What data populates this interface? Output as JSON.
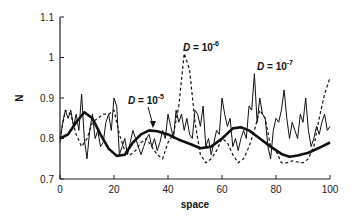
{
  "chart_data": {
    "type": "line",
    "title": "",
    "xlabel": "space",
    "ylabel": "N",
    "xlim": [
      0,
      100
    ],
    "ylim": [
      0.7,
      1.1
    ],
    "x_ticks": [
      "0",
      "20",
      "40",
      "60",
      "80",
      "100"
    ],
    "y_ticks": [
      "0.7",
      "0.8",
      "0.9",
      "1",
      "1.1"
    ],
    "grid": false,
    "legend": "none (inline annotations)",
    "annotations": [
      {
        "text_base": "D = 10",
        "exponent": "-5",
        "x": 35,
        "y": 0.82
      },
      {
        "text_base": "D = 10",
        "exponent": "-6",
        "x": 46,
        "y": 1.01
      },
      {
        "text_base": "D = 10",
        "exponent": "-7",
        "x": 72,
        "y": 0.96
      }
    ],
    "series": [
      {
        "name": "D = 10^-5",
        "style": "thick solid",
        "x": [
          0,
          3,
          6,
          9,
          12,
          15,
          18,
          21,
          24,
          27,
          30,
          33,
          36,
          40,
          44,
          48,
          52,
          56,
          60,
          64,
          67,
          70,
          74,
          78,
          82,
          85,
          88,
          92,
          96,
          100
        ],
        "y": [
          0.8,
          0.81,
          0.84,
          0.865,
          0.85,
          0.81,
          0.775,
          0.757,
          0.76,
          0.79,
          0.81,
          0.82,
          0.818,
          0.81,
          0.797,
          0.787,
          0.776,
          0.78,
          0.8,
          0.825,
          0.828,
          0.82,
          0.8,
          0.78,
          0.762,
          0.755,
          0.758,
          0.765,
          0.777,
          0.79
        ]
      },
      {
        "name": "D = 10^-6",
        "style": "dashed",
        "x": [
          0,
          2,
          4,
          6,
          8,
          10,
          12,
          14,
          16,
          18,
          20,
          22,
          24,
          26,
          28,
          30,
          32,
          34,
          36,
          38,
          40,
          42,
          44,
          46,
          48,
          50,
          52,
          54,
          56,
          58,
          60,
          62,
          64,
          66,
          68,
          70,
          72,
          74,
          76,
          78,
          80,
          82,
          84,
          86,
          88,
          90,
          92,
          94,
          96,
          98,
          100
        ],
        "y": [
          0.8,
          0.87,
          0.86,
          0.81,
          0.78,
          0.8,
          0.84,
          0.85,
          0.86,
          0.86,
          0.87,
          0.81,
          0.77,
          0.76,
          0.77,
          0.79,
          0.8,
          0.78,
          0.76,
          0.75,
          0.79,
          0.81,
          0.88,
          1.01,
          0.97,
          0.84,
          0.76,
          0.74,
          0.75,
          0.77,
          0.8,
          0.79,
          0.76,
          0.74,
          0.75,
          0.78,
          0.82,
          0.87,
          0.85,
          0.78,
          0.77,
          0.74,
          0.74,
          0.745,
          0.742,
          0.74,
          0.75,
          0.78,
          0.85,
          0.91,
          0.95
        ]
      },
      {
        "name": "D = 10^-7",
        "style": "thin solid",
        "x": [
          0,
          1,
          2,
          3,
          4,
          5,
          6,
          7,
          8,
          9,
          10,
          11,
          12,
          13,
          14,
          15,
          16,
          17,
          18,
          19,
          20,
          21,
          22,
          23,
          24,
          25,
          26,
          27,
          28,
          29,
          30,
          31,
          32,
          33,
          34,
          35,
          36,
          37,
          38,
          39,
          40,
          41,
          42,
          43,
          44,
          45,
          46,
          47,
          48,
          49,
          50,
          51,
          52,
          53,
          54,
          55,
          56,
          57,
          58,
          59,
          60,
          61,
          62,
          63,
          64,
          65,
          66,
          67,
          68,
          69,
          70,
          71,
          72,
          73,
          74,
          75,
          76,
          77,
          78,
          79,
          80,
          81,
          82,
          83,
          84,
          85,
          86,
          87,
          88,
          89,
          90,
          91,
          92,
          93,
          94,
          95,
          96,
          97,
          98,
          99,
          100
        ],
        "y": [
          0.79,
          0.84,
          0.87,
          0.85,
          0.87,
          0.83,
          0.86,
          0.82,
          0.91,
          0.8,
          0.75,
          0.82,
          0.86,
          0.8,
          0.82,
          0.78,
          0.79,
          0.84,
          0.86,
          0.82,
          0.9,
          0.88,
          0.76,
          0.78,
          0.8,
          0.76,
          0.79,
          0.82,
          0.8,
          0.78,
          0.76,
          0.78,
          0.8,
          0.81,
          0.78,
          0.8,
          0.77,
          0.79,
          0.82,
          0.8,
          0.86,
          0.83,
          0.8,
          0.87,
          0.84,
          0.86,
          0.82,
          0.85,
          0.81,
          0.8,
          0.87,
          0.86,
          0.83,
          0.88,
          0.78,
          0.8,
          0.76,
          0.79,
          0.82,
          0.81,
          0.9,
          0.86,
          0.83,
          0.85,
          0.78,
          0.8,
          0.77,
          0.8,
          0.82,
          0.8,
          0.88,
          0.87,
          0.96,
          0.84,
          0.9,
          0.86,
          0.85,
          0.78,
          0.75,
          0.82,
          0.85,
          0.84,
          0.87,
          0.92,
          0.85,
          0.8,
          0.84,
          0.82,
          0.8,
          0.86,
          0.84,
          0.9,
          0.82,
          0.78,
          0.8,
          0.83,
          0.81,
          0.84,
          0.86,
          0.82,
          0.83
        ]
      }
    ]
  }
}
